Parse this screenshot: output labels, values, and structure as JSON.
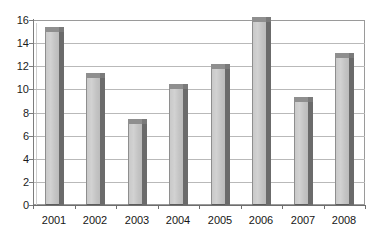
{
  "chart_data": {
    "type": "bar",
    "title": "",
    "subtitle": "",
    "xlabel": "",
    "ylabel": "",
    "categories": [
      "2001",
      "2002",
      "2003",
      "2004",
      "2005",
      "2006",
      "2007",
      "2008"
    ],
    "values": [
      15,
      11,
      7,
      10,
      11.8,
      15.8,
      8.9,
      12.7
    ],
    "series": [
      {
        "name": "Series 1",
        "values": [
          15,
          11,
          7,
          10,
          11.8,
          15.8,
          8.9,
          12.7
        ]
      }
    ],
    "ylim": [
      0,
      16
    ],
    "ytick_step": 2,
    "yticks": [
      "0",
      "2",
      "4",
      "6",
      "8",
      "10",
      "12",
      "14",
      "16"
    ],
    "ytick_values": [
      0,
      2,
      4,
      6,
      8,
      10,
      12,
      14,
      16
    ],
    "grid": "horizontal",
    "legend": "none",
    "style": "3d-column-grayscale",
    "colors": {
      "bar_face": "#cbcbcb",
      "bar_side": "#6b6b6b",
      "bar_top": "#8f8f8f",
      "gridline": "#b9b9b9",
      "axis": "#6e6e6e",
      "text": "#161616",
      "background": "#ffffff"
    }
  }
}
